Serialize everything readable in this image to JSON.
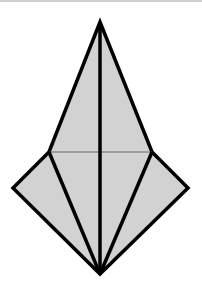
{
  "diagram": {
    "type": "origami-fold-diagram",
    "fill_color": "#d2d2d2",
    "stroke_color": "#000000",
    "crease_color": "#555555",
    "vertices": {
      "top": [
        100,
        22
      ],
      "upper_left": [
        49,
        152
      ],
      "upper_right": [
        152,
        152
      ],
      "far_left": [
        13,
        188
      ],
      "far_right": [
        188,
        188
      ],
      "bottom": [
        100,
        274
      ]
    }
  }
}
